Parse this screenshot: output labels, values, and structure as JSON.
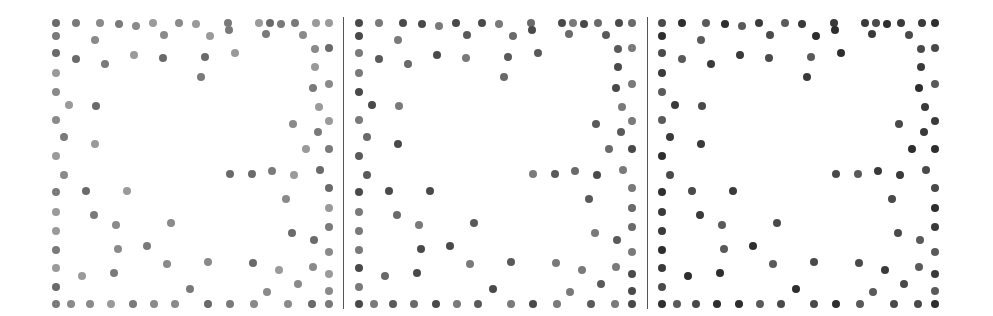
{
  "panels": [
    {
      "name": "panel-1",
      "offset_x": 0,
      "shades": [
        "#7a7a7a",
        "#8a8a8a",
        "#9a9a9a",
        "#6a6a6a"
      ]
    },
    {
      "name": "panel-2",
      "offset_x": 303,
      "shades": [
        "#6a6a6a",
        "#7a7a7a",
        "#5a5a5a",
        "#4a4a4a"
      ]
    },
    {
      "name": "panel-3",
      "offset_x": 606,
      "shades": [
        "#3a3a3a",
        "#5a5a5a",
        "#2e2e2e",
        "#4a4a4a"
      ]
    }
  ],
  "dividers": [
    343,
    647
  ],
  "dots": [
    [
      56,
      23,
      3
    ],
    [
      76,
      23,
      3
    ],
    [
      100,
      23,
      3
    ],
    [
      119,
      24,
      1
    ],
    [
      136,
      26,
      1
    ],
    [
      153,
      23,
      1
    ],
    [
      179,
      23,
      3
    ],
    [
      196,
      24,
      3
    ],
    [
      228,
      23,
      0
    ],
    [
      259,
      23,
      1
    ],
    [
      270,
      23,
      1
    ],
    [
      281,
      24,
      1
    ],
    [
      295,
      23,
      0
    ],
    [
      316,
      23,
      1
    ],
    [
      329,
      23,
      0
    ],
    [
      56,
      36,
      1
    ],
    [
      95,
      40,
      1
    ],
    [
      164,
      35,
      0
    ],
    [
      210,
      36,
      0
    ],
    [
      229,
      30,
      1
    ],
    [
      266,
      34,
      0
    ],
    [
      303,
      35,
      0
    ],
    [
      56,
      53,
      1
    ],
    [
      76,
      59,
      0
    ],
    [
      105,
      64,
      0
    ],
    [
      134,
      55,
      1
    ],
    [
      163,
      58,
      1
    ],
    [
      205,
      57,
      0
    ],
    [
      235,
      53,
      2
    ],
    [
      315,
      49,
      0
    ],
    [
      329,
      48,
      1
    ],
    [
      56,
      73,
      3
    ],
    [
      201,
      77,
      0
    ],
    [
      315,
      67,
      1
    ],
    [
      56,
      92,
      3
    ],
    [
      313,
      88,
      1
    ],
    [
      329,
      84,
      1
    ],
    [
      69,
      105,
      1
    ],
    [
      96,
      106,
      1
    ],
    [
      319,
      107,
      3
    ],
    [
      56,
      120,
      1
    ],
    [
      293,
      124,
      0
    ],
    [
      318,
      132,
      2
    ],
    [
      329,
      121,
      3
    ],
    [
      64,
      137,
      0
    ],
    [
      95,
      144,
      1
    ],
    [
      306,
      149,
      0
    ],
    [
      329,
      149,
      1
    ],
    [
      56,
      156,
      2
    ],
    [
      64,
      175,
      0
    ],
    [
      230,
      174,
      1
    ],
    [
      252,
      174,
      0
    ],
    [
      272,
      171,
      0
    ],
    [
      294,
      175,
      1
    ],
    [
      320,
      170,
      1
    ],
    [
      56,
      192,
      1
    ],
    [
      86,
      191,
      3
    ],
    [
      127,
      191,
      1
    ],
    [
      329,
      188,
      1
    ],
    [
      56,
      212,
      3
    ],
    [
      94,
      215,
      0
    ],
    [
      286,
      199,
      0
    ],
    [
      329,
      208,
      0
    ],
    [
      56,
      231,
      3
    ],
    [
      116,
      225,
      1
    ],
    [
      171,
      223,
      0
    ],
    [
      292,
      233,
      1
    ],
    [
      314,
      240,
      0
    ],
    [
      329,
      227,
      0
    ],
    [
      56,
      250,
      3
    ],
    [
      118,
      249,
      3
    ],
    [
      147,
      246,
      1
    ],
    [
      329,
      252,
      1
    ],
    [
      56,
      268,
      1
    ],
    [
      82,
      276,
      0
    ],
    [
      114,
      273,
      1
    ],
    [
      167,
      264,
      1
    ],
    [
      208,
      262,
      0
    ],
    [
      253,
      263,
      1
    ],
    [
      279,
      270,
      3
    ],
    [
      313,
      267,
      1
    ],
    [
      329,
      274,
      1
    ],
    [
      56,
      287,
      1
    ],
    [
      190,
      289,
      1
    ],
    [
      267,
      292,
      1
    ],
    [
      298,
      284,
      0
    ],
    [
      329,
      291,
      3
    ],
    [
      56,
      304,
      1
    ],
    [
      71,
      304,
      1
    ],
    [
      90,
      304,
      0
    ],
    [
      111,
      304,
      0
    ],
    [
      133,
      304,
      1
    ],
    [
      154,
      304,
      1
    ],
    [
      175,
      304,
      0
    ],
    [
      208,
      304,
      1
    ],
    [
      230,
      304,
      1
    ],
    [
      254,
      304,
      1
    ],
    [
      288,
      304,
      0
    ],
    [
      312,
      304,
      1
    ],
    [
      329,
      304,
      1
    ]
  ]
}
